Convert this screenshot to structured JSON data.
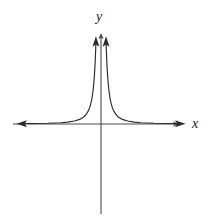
{
  "figure": {
    "kind": "cartesian-graph",
    "background_color": "#ffffff",
    "stroke_color": "#1a1a1a",
    "axis_color": "#4a4a4a",
    "curve_color": "#2b2b2b",
    "axes": {
      "x_label": "x",
      "y_label": "y",
      "x_axis_name": "x-axis",
      "y_axis_name": "y-axis",
      "origin_x": 101,
      "origin_y": 124,
      "x_axis_start": 13,
      "x_axis_end": 181,
      "y_axis_top": 31,
      "y_axis_bottom": 214,
      "x_arrowheads": [
        "right"
      ],
      "y_arrowheads": [
        "up"
      ]
    },
    "curve": {
      "name": "reciprocal-curve",
      "equation_shape": "y = a / x^2",
      "vertical_asymptote": "x = 0",
      "horizontal_asymptote": "y = 0",
      "branches": [
        {
          "name": "left-branch",
          "domain": "x < 0",
          "arrow_ends": [
            "left",
            "up"
          ]
        },
        {
          "name": "right-branch",
          "domain": "x > 0",
          "arrow_ends": [
            "right",
            "up"
          ]
        }
      ],
      "left_arrow_tip": {
        "x": 14,
        "y": 117
      },
      "right_arrow_tip": {
        "x": 179,
        "y": 117
      },
      "left_top_arrow_tip": {
        "x": 92,
        "y": 36
      },
      "right_top_arrow_tip": {
        "x": 110,
        "y": 36
      }
    }
  },
  "chart_data": {
    "type": "line",
    "title": "",
    "xlabel": "x",
    "ylabel": "y",
    "grid": false,
    "legend": null,
    "xlim": [
      -6,
      6
    ],
    "ylim": [
      0,
      7
    ],
    "equation": "y = 1/x^2",
    "asymptotes": {
      "vertical": 0,
      "horizontal": 0
    },
    "series": [
      {
        "name": "left-branch",
        "x": [
          -6.0,
          -5.0,
          -4.0,
          -3.0,
          -2.5,
          -2.0,
          -1.6,
          -1.3,
          -1.1,
          -0.95,
          -0.85,
          -0.75,
          -0.68,
          -0.62,
          -0.57,
          -0.53,
          -0.5,
          -0.46,
          -0.43,
          -0.4,
          -0.38
        ],
        "y": [
          0.03,
          0.04,
          0.06,
          0.11,
          0.16,
          0.25,
          0.39,
          0.59,
          0.83,
          1.11,
          1.38,
          1.78,
          2.16,
          2.6,
          3.08,
          3.56,
          4.0,
          4.72,
          5.41,
          6.25,
          6.93
        ]
      },
      {
        "name": "right-branch",
        "x": [
          0.38,
          0.4,
          0.43,
          0.46,
          0.5,
          0.53,
          0.57,
          0.62,
          0.68,
          0.75,
          0.85,
          0.95,
          1.1,
          1.3,
          1.6,
          2.0,
          2.5,
          3.0,
          4.0,
          5.0,
          6.0
        ],
        "y": [
          6.93,
          6.25,
          5.41,
          4.72,
          4.0,
          3.56,
          3.08,
          2.6,
          2.16,
          1.78,
          1.38,
          1.11,
          0.83,
          0.59,
          0.39,
          0.25,
          0.16,
          0.11,
          0.06,
          0.04,
          0.03
        ]
      }
    ]
  }
}
